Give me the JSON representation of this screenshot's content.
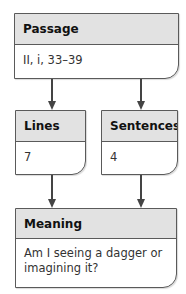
{
  "nodes": {
    "passage": {
      "title": "Passage",
      "value": "II, i, 33–39"
    },
    "lines": {
      "title": "Lines",
      "value": "7"
    },
    "sentences": {
      "title": "Sentences",
      "value": "4"
    },
    "meaning": {
      "title": "Meaning",
      "value": "Am I seeing a dagger or imagining it?"
    }
  },
  "edges": [
    {
      "from": "Passage",
      "to": "Lines"
    },
    {
      "from": "Passage",
      "to": "Sentences"
    },
    {
      "from": "Lines",
      "to": "Meaning"
    },
    {
      "from": "Sentences",
      "to": "Meaning"
    }
  ],
  "colors": {
    "header_bg": "#e2e2e2",
    "border": "#5a5a5a",
    "arrow": "#444444"
  }
}
